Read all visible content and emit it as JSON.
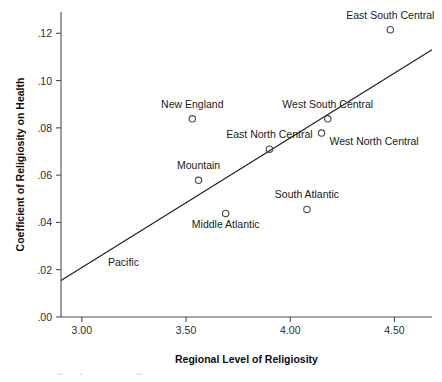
{
  "chart_data": {
    "type": "scatter",
    "title": "",
    "xlabel": "Regional Level of Religiosity",
    "ylabel": "Coefficient of Religiosity on Health",
    "xlim": [
      2.9,
      4.68
    ],
    "ylim": [
      0.0,
      0.129
    ],
    "grid": false,
    "legend": "none",
    "xticks": [
      "3.00",
      "3.50",
      "4.00",
      "4.50"
    ],
    "xtick_values": [
      3.0,
      3.5,
      4.0,
      4.5
    ],
    "yticks": [
      ".00",
      ".02",
      ".04",
      ".06",
      ".08",
      ".10",
      ".12"
    ],
    "ytick_values": [
      0.0,
      0.02,
      0.04,
      0.06,
      0.08,
      0.1,
      0.12
    ],
    "points": [
      {
        "label": "East South Central",
        "x": 4.48,
        "y": 0.1215,
        "label_dx": 0,
        "label_dy": -11,
        "label_anchor": "middle"
      },
      {
        "label": "New England",
        "x": 3.53,
        "y": 0.0838,
        "label_dx": 0,
        "label_dy": -11,
        "label_anchor": "middle"
      },
      {
        "label": "West South Central",
        "x": 4.18,
        "y": 0.0838,
        "label_dx": 0,
        "label_dy": -11,
        "label_anchor": "middle"
      },
      {
        "label": "West North Central",
        "x": 4.15,
        "y": 0.0778,
        "label_dx": 8,
        "label_dy": 12,
        "label_anchor": "start"
      },
      {
        "label": "East North Central",
        "x": 3.9,
        "y": 0.071,
        "label_dx": 0,
        "label_dy": -11,
        "label_anchor": "middle"
      },
      {
        "label": "Mountain",
        "x": 3.56,
        "y": 0.0578,
        "label_dx": 0,
        "label_dy": -11,
        "label_anchor": "middle"
      },
      {
        "label": "Middle Atlantic",
        "x": 3.69,
        "y": 0.0438,
        "label_dx": 0,
        "label_dy": 15,
        "label_anchor": "middle"
      },
      {
        "label": "South Atlantic",
        "x": 4.08,
        "y": 0.0455,
        "label_dx": 0,
        "label_dy": -11,
        "label_anchor": "middle"
      },
      {
        "label": "Pacific",
        "x": 3.02,
        "y": 0.0235,
        "label_dx": 22,
        "label_dy": 5,
        "label_anchor": "start",
        "marker_hidden": true
      }
    ],
    "fit_line": {
      "name": "linear fit",
      "x0": 2.9,
      "y0": 0.0154,
      "x1": 4.68,
      "y1": 0.113
    },
    "annotations": []
  },
  "caption": {
    "text": "Effect of religiosity on health: regional estimates"
  }
}
